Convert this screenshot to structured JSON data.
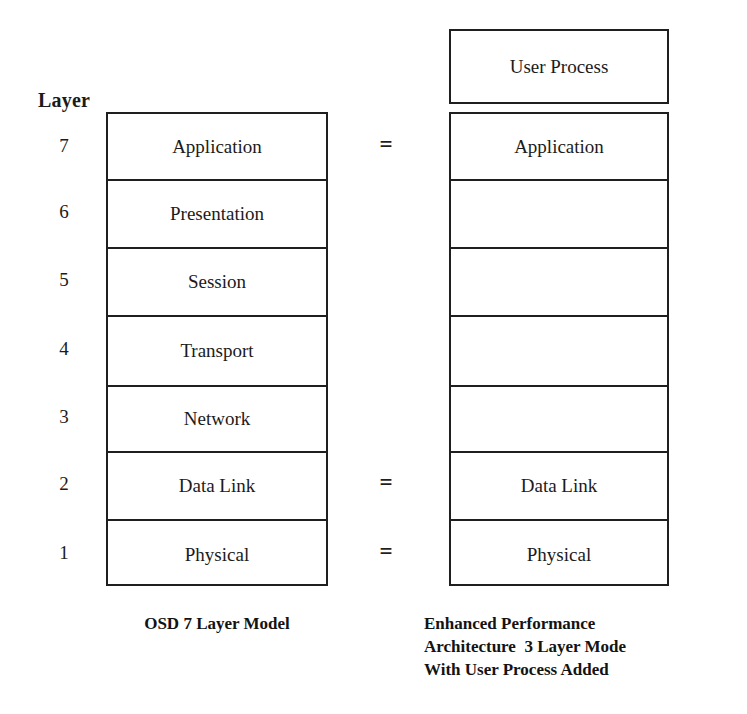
{
  "diagram": {
    "layer_axis": {
      "heading": "Layer",
      "numbers": [
        "7",
        "6",
        "5",
        "4",
        "3",
        "2",
        "1"
      ]
    },
    "osd_stack": {
      "caption": "OSD 7 Layer Model",
      "layers": [
        {
          "number": "7",
          "label": "Application"
        },
        {
          "number": "6",
          "label": "Presentation"
        },
        {
          "number": "5",
          "label": "Session"
        },
        {
          "number": "4",
          "label": "Transport"
        },
        {
          "number": "3",
          "label": "Network"
        },
        {
          "number": "2",
          "label": "Data Link"
        },
        {
          "number": "1",
          "label": "Physical"
        }
      ]
    },
    "epa_stack": {
      "top_box_label": "User Process",
      "caption_lines": [
        "Enhanced Performance",
        "Architecture  3 Layer Mode",
        "With User Process Added"
      ],
      "layers": [
        {
          "number": "7",
          "label": "Application"
        },
        {
          "number": "6",
          "label": ""
        },
        {
          "number": "5",
          "label": ""
        },
        {
          "number": "4",
          "label": ""
        },
        {
          "number": "3",
          "label": ""
        },
        {
          "number": "2",
          "label": "Data Link"
        },
        {
          "number": "1",
          "label": "Physical"
        }
      ]
    },
    "equivalences": [
      {
        "symbol": "=",
        "at_layer": "7"
      },
      {
        "symbol": "=",
        "at_layer": "2"
      },
      {
        "symbol": "=",
        "at_layer": "1"
      }
    ],
    "colors": {
      "ink": "#1f1f1f",
      "text": "#1b1b1b",
      "background": "#ffffff"
    }
  }
}
